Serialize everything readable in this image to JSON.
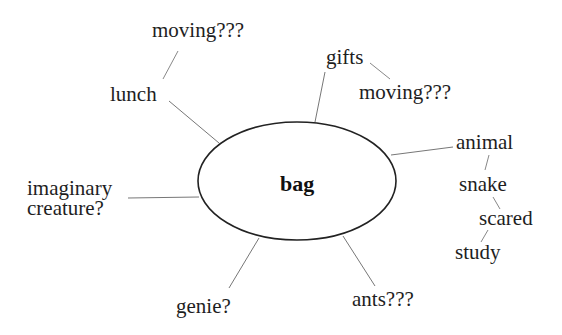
{
  "diagram": {
    "type": "mind-map",
    "center": {
      "label": "bag"
    },
    "nodes": {
      "moving_top": "moving???",
      "lunch": "lunch",
      "gifts": "gifts",
      "moving_right": "moving???",
      "animal": "animal",
      "snake": "snake",
      "scared": "scared",
      "study": "study",
      "imaginary_line1": "imaginary",
      "imaginary_line2": "creature?",
      "genie": "genie?",
      "ants": "ants???"
    },
    "edges": [
      [
        "bag",
        "lunch"
      ],
      [
        "lunch",
        "moving???"
      ],
      [
        "bag",
        "gifts"
      ],
      [
        "gifts",
        "moving???"
      ],
      [
        "bag",
        "animal"
      ],
      [
        "animal",
        "snake"
      ],
      [
        "snake",
        "scared"
      ],
      [
        "scared",
        "study"
      ],
      [
        "bag",
        "imaginary creature?"
      ],
      [
        "bag",
        "genie?"
      ],
      [
        "bag",
        "ants???"
      ]
    ],
    "colors": {
      "ellipse_stroke": "#222222",
      "line": "#777777",
      "text": "#1e1e1e"
    }
  }
}
